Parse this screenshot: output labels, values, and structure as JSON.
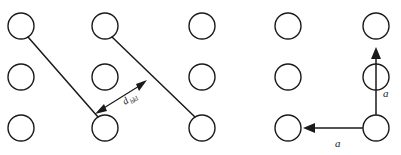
{
  "figure": {
    "name": "crystal-lattice-planes-diagram",
    "width": 401,
    "height": 155,
    "background_color": "#ffffff",
    "stroke_color": "#1a1a1a"
  },
  "lattice": {
    "rows": 3,
    "columns": 5,
    "atom_count": 15,
    "atom_radius": 13,
    "column_centers_x": [
      21,
      105,
      202,
      288,
      376
    ],
    "row_centers_y": [
      26,
      77,
      128
    ],
    "atom_style": "open-circle"
  },
  "planes": {
    "count": 2,
    "description": "two parallel lattice planes drawn as diagonal lines",
    "lines": [
      {
        "x1": 21,
        "y1": 26,
        "x2": 105,
        "y2": 128
      },
      {
        "x1": 105,
        "y1": 26,
        "x2": 202,
        "y2": 128
      }
    ]
  },
  "spacing_dimension": {
    "label_main": "d",
    "label_subscript": "hkl",
    "label_full": "d_hkl",
    "arrow_type": "double-headed",
    "from": {
      "x": 96,
      "y": 113
    },
    "to": {
      "x": 146,
      "y": 81
    },
    "label_x": 128,
    "label_y": 106,
    "label_rotation_deg": -33
  },
  "lattice_vectors": [
    {
      "label": "a",
      "direction": "up",
      "origin": {
        "x": 376,
        "y": 128
      },
      "tip": {
        "x": 376,
        "y": 49
      },
      "label_x": 383,
      "label_y": 94
    },
    {
      "label": "a",
      "direction": "left",
      "origin": {
        "x": 376,
        "y": 128
      },
      "tip": {
        "x": 304,
        "y": 128
      },
      "label_x": 338,
      "label_y": 146
    }
  ]
}
